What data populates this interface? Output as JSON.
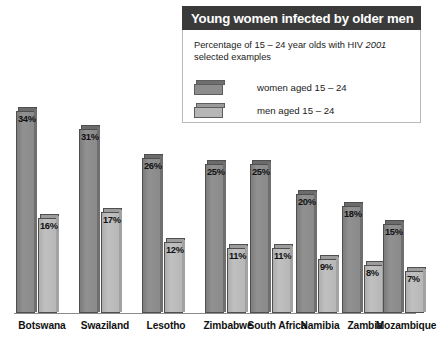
{
  "legend_panel": {
    "title": "Young women infected by older men",
    "subtitle_prefix": "Percentage of 15 – 24 year olds with HIV ",
    "subtitle_year": "2001",
    "subtitle_suffix": "selected examples",
    "entries": [
      {
        "label": "women aged 15 – 24",
        "swatch": "women-swatch",
        "color": "#8d8d8d"
      },
      {
        "label": "men aged 15 – 24",
        "swatch": "men-swatch",
        "color": "#b6b6b6"
      }
    ]
  },
  "chart_data": {
    "type": "bar",
    "title": "Young women infected by older men",
    "subtitle": "Percentage of 15 – 24 year olds with HIV 2001 selected examples",
    "xlabel": "",
    "ylabel": "",
    "ylim": [
      0,
      35
    ],
    "grid": false,
    "legend_position": "top-right",
    "categories": [
      "Botswana",
      "Swaziland",
      "Lesotho",
      "Zimbabwe",
      "South Africa",
      "Namibia",
      "Zambia",
      "Mozambique"
    ],
    "series": [
      {
        "name": "women aged 15 – 24",
        "color": "#8d8d8d",
        "values": [
          34,
          31,
          26,
          25,
          25,
          20,
          18,
          15
        ],
        "labels": [
          "34%",
          "31%",
          "26%",
          "25%",
          "25%",
          "20%",
          "18%",
          "15%"
        ]
      },
      {
        "name": "men aged 15 – 24",
        "color": "#b6b6b6",
        "values": [
          16,
          17,
          12,
          11,
          11,
          9,
          8,
          7
        ],
        "labels": [
          "16%",
          "17%",
          "12%",
          "11%",
          "11%",
          "9%",
          "8%",
          "7%"
        ]
      }
    ]
  }
}
